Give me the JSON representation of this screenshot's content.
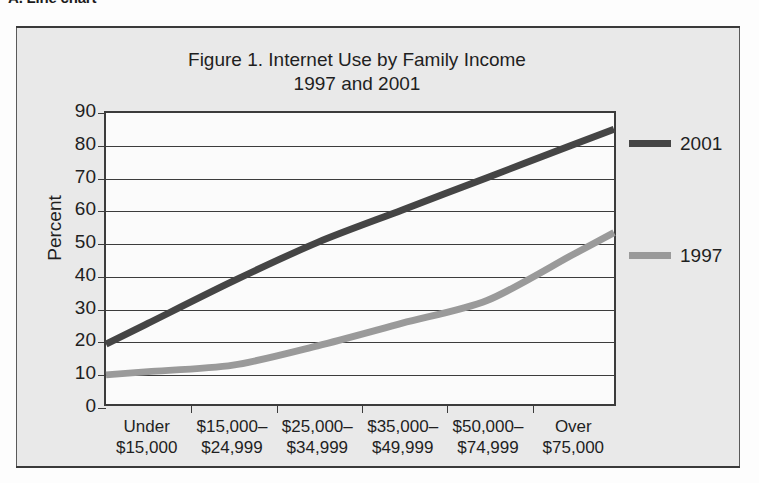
{
  "section_heading": "A. Line chart",
  "figure": {
    "title": "Figure 1. Internet Use by Family Income",
    "subtitle": "1997 and 2001"
  },
  "colors": {
    "series_2001": "#454545",
    "series_1997": "#9a9a9a",
    "axis": "#3c3c3c",
    "frame": "#5a5a5a",
    "figure_background": "#e9e9e9",
    "plot_background": "#fbfbfb",
    "text": "#1f1f1f"
  },
  "chart_data": {
    "type": "line",
    "title": "Figure 1. Internet Use by Family Income",
    "subtitle": "1997 and 2001",
    "xlabel": "",
    "ylabel": "Percent",
    "categories": [
      "Under $15,000",
      "$15,000–$24,999",
      "$25,000–$34,999",
      "$35,000–$49,999",
      "$50,000–$74,999",
      "Over $75,000"
    ],
    "category_lines": [
      [
        "Under",
        "$15,000"
      ],
      [
        "$15,000–",
        "$24,999"
      ],
      [
        "$25,000–",
        "$34,999"
      ],
      [
        "$35,000–",
        "$49,999"
      ],
      [
        "$50,000–",
        "$74,999"
      ],
      [
        "Over",
        "$75,000"
      ]
    ],
    "series": [
      {
        "name": "2001",
        "color": "#454545",
        "values": [
          25,
          38,
          50,
          60,
          70,
          80
        ]
      },
      {
        "name": "1997",
        "color": "#9a9a9a",
        "values": [
          10,
          12,
          18,
          25,
          32,
          46
        ]
      }
    ],
    "ylim": [
      0,
      90
    ],
    "ytick_labels": [
      "90",
      "80",
      "70",
      "60",
      "50",
      "40",
      "30",
      "20",
      "10",
      "0"
    ],
    "ytick_values": [
      90,
      80,
      70,
      60,
      50,
      40,
      30,
      20,
      10,
      0
    ],
    "grid": true,
    "legend_position": "right",
    "legend": [
      "2001",
      "1997"
    ]
  }
}
